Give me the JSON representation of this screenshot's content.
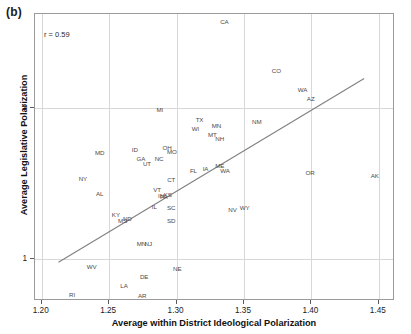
{
  "figure": {
    "panel_label": "(b)",
    "annotation": "r = 0.59"
  },
  "chart_data": {
    "type": "scatter",
    "title": "",
    "xlabel": "Average within District Ideological Polarization",
    "ylabel": "Average Legislative Polarization",
    "xlim": [
      1.195,
      1.462
    ],
    "ylim": [
      0.72,
      2.62
    ],
    "xticks": [
      "1.20",
      "1.25",
      "1.30",
      "1.35",
      "1.40",
      "1.45"
    ],
    "xtick_values": [
      1.2,
      1.25,
      1.3,
      1.35,
      1.4,
      1.45
    ],
    "yticks": [
      "1",
      "2"
    ],
    "ytick_values": [
      1,
      2
    ],
    "grid": true,
    "legend": "none",
    "annotations": [
      {
        "name": "correlation",
        "text": "r = 0.59",
        "value": 0.59
      }
    ],
    "marker_style": "text-label",
    "point_label_field": "state",
    "trendline": {
      "type": "linear-fit",
      "color": "#808080",
      "x_start": 1.2125,
      "y_start": 0.965,
      "x_end": 1.4405,
      "y_end": 2.19
    },
    "points": [
      {
        "state": "CA",
        "x": 1.3355,
        "y": 2.565
      },
      {
        "state": "CO",
        "x": 1.374,
        "y": 2.245
      },
      {
        "state": "WA",
        "x": 1.3935,
        "y": 2.12
      },
      {
        "state": "AZ",
        "x": 1.3995,
        "y": 2.055
      },
      {
        "state": "MI",
        "x": 1.2875,
        "y": 1.985
      },
      {
        "state": "TX",
        "x": 1.317,
        "y": 1.915
      },
      {
        "state": "NM",
        "x": 1.3595,
        "y": 1.905
      },
      {
        "state": "WI",
        "x": 1.314,
        "y": 1.86
      },
      {
        "state": "MN",
        "x": 1.3295,
        "y": 1.88
      },
      {
        "state": "MT",
        "x": 1.3265,
        "y": 1.82
      },
      {
        "state": "NH",
        "x": 1.332,
        "y": 1.79
      },
      {
        "state": "MD",
        "x": 1.243,
        "y": 1.7
      },
      {
        "state": "ID",
        "x": 1.269,
        "y": 1.72
      },
      {
        "state": "OH",
        "x": 1.293,
        "y": 1.73
      },
      {
        "state": "MO",
        "x": 1.2965,
        "y": 1.705
      },
      {
        "state": "GA",
        "x": 1.2735,
        "y": 1.66
      },
      {
        "state": "UT",
        "x": 1.278,
        "y": 1.63
      },
      {
        "state": "NC",
        "x": 1.287,
        "y": 1.66
      },
      {
        "state": "FL",
        "x": 1.3125,
        "y": 1.58
      },
      {
        "state": "IA",
        "x": 1.3215,
        "y": 1.595
      },
      {
        "state": "ME",
        "x": 1.332,
        "y": 1.615
      },
      {
        "state": "WA2",
        "x": 1.336,
        "y": 1.58
      },
      {
        "state": "OR",
        "x": 1.399,
        "y": 1.565
      },
      {
        "state": "AK",
        "x": 1.447,
        "y": 1.545
      },
      {
        "state": "NY",
        "x": 1.2305,
        "y": 1.53
      },
      {
        "state": "CT",
        "x": 1.296,
        "y": 1.52
      },
      {
        "state": "VT",
        "x": 1.2855,
        "y": 1.455
      },
      {
        "state": "AL",
        "x": 1.243,
        "y": 1.43
      },
      {
        "state": "KS",
        "x": 1.2935,
        "y": 1.425
      },
      {
        "state": "IN",
        "x": 1.2885,
        "y": 1.415
      },
      {
        "state": "PA",
        "x": 1.2905,
        "y": 1.41
      },
      {
        "state": "NV",
        "x": 1.3415,
        "y": 1.32
      },
      {
        "state": "WY",
        "x": 1.3505,
        "y": 1.335
      },
      {
        "state": "SC",
        "x": 1.296,
        "y": 1.335
      },
      {
        "state": "IL",
        "x": 1.2835,
        "y": 1.34
      },
      {
        "state": "KY",
        "x": 1.255,
        "y": 1.29
      },
      {
        "state": "MS",
        "x": 1.26,
        "y": 1.25
      },
      {
        "state": "ND",
        "x": 1.2635,
        "y": 1.265
      },
      {
        "state": "SD",
        "x": 1.296,
        "y": 1.25
      },
      {
        "state": "MN2",
        "x": 1.274,
        "y": 1.095
      },
      {
        "state": "NJ",
        "x": 1.279,
        "y": 1.095
      },
      {
        "state": "WV",
        "x": 1.237,
        "y": 0.945
      },
      {
        "state": "NE",
        "x": 1.3005,
        "y": 0.93
      },
      {
        "state": "DE",
        "x": 1.276,
        "y": 0.88
      },
      {
        "state": "LA",
        "x": 1.261,
        "y": 0.82
      },
      {
        "state": "RI",
        "x": 1.2225,
        "y": 0.76
      },
      {
        "state": "AR",
        "x": 1.2745,
        "y": 0.755
      }
    ]
  }
}
